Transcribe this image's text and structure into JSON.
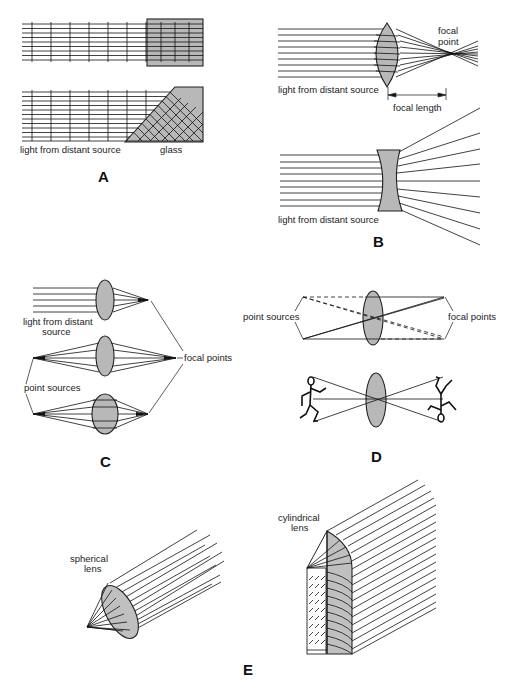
{
  "figure": {
    "panels": [
      {
        "id": "A",
        "label": "A",
        "labels": {
          "source": "light from distant source",
          "glass": "glass"
        }
      },
      {
        "id": "B",
        "label": "B",
        "labels": {
          "focal_point": [
            "focal",
            "point"
          ],
          "source_top": "light from distant source",
          "focal_length": "focal length",
          "source_bottom": "light from distant source"
        }
      },
      {
        "id": "C",
        "label": "C",
        "labels": {
          "source": [
            "light from distant",
            "source"
          ],
          "focal_points": "focal points",
          "point_sources": "point sources"
        }
      },
      {
        "id": "D",
        "label": "D",
        "labels": {
          "point_sources": "point sources",
          "focal_points": "focal points"
        }
      },
      {
        "id": "E",
        "label": "E",
        "labels": {
          "spherical": [
            "spherical",
            "lens"
          ],
          "cylindrical": [
            "cylindrical",
            "lens"
          ]
        }
      }
    ],
    "colors": {
      "glass_fill": "#b8b8b8",
      "line": "#111111",
      "background": "#ffffff"
    }
  }
}
